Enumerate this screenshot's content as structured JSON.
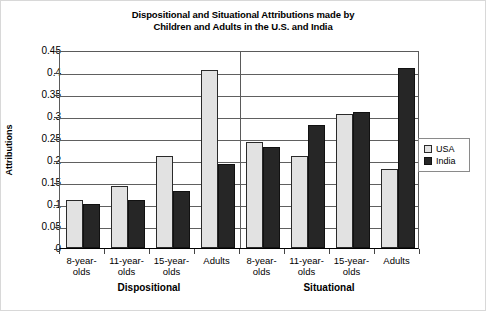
{
  "chart_data": {
    "type": "bar",
    "title": "Dispositional and Situational Attributions made by Children and Adults in the U.S. and India",
    "title_line1": "Dispositional and Situational Attributions made by",
    "title_line2": "Children and Adults in the U.S. and India",
    "xlabel": "",
    "ylabel": "Attributions",
    "ylim": [
      0,
      0.45
    ],
    "ytick_labels": [
      "0.45",
      "0.4",
      "0.35",
      "0.3",
      "0.25",
      "0.2",
      "0.15",
      "0.1",
      "0.05",
      "0"
    ],
    "ytick_values": [
      0.45,
      0.4,
      0.35,
      0.3,
      0.25,
      0.2,
      0.15,
      0.1,
      0.05,
      0
    ],
    "grid": true,
    "grid_axis": "y",
    "legend_position": "right",
    "categories": [
      "8-year-olds",
      "11-year-olds",
      "15-year-olds",
      "Adults",
      "8-year-olds",
      "11-year-olds",
      "15-year-olds",
      "Adults"
    ],
    "category_lines": [
      [
        "8-year-",
        "olds"
      ],
      [
        "11-year-",
        "olds"
      ],
      [
        "15-year-",
        "olds"
      ],
      [
        "Adults",
        ""
      ],
      [
        "8-year-",
        "olds"
      ],
      [
        "11-year-",
        "olds"
      ],
      [
        "15-year-",
        "olds"
      ],
      [
        "Adults",
        ""
      ]
    ],
    "groups": [
      {
        "label": "Dispositional",
        "categories": [
          "8-year-olds",
          "11-year-olds",
          "15-year-olds",
          "Adults"
        ]
      },
      {
        "label": "Situational",
        "categories": [
          "8-year-olds",
          "11-year-olds",
          "15-year-olds",
          "Adults"
        ]
      }
    ],
    "series": [
      {
        "name": "USA",
        "color": "#e2e2e2",
        "values": [
          0.11,
          0.14,
          0.21,
          0.405,
          0.24,
          0.21,
          0.305,
          0.18
        ]
      },
      {
        "name": "India",
        "color": "#262626",
        "values": [
          0.1,
          0.11,
          0.13,
          0.19,
          0.23,
          0.28,
          0.31,
          0.41
        ]
      }
    ]
  },
  "legend": {
    "items": [
      {
        "label": "USA",
        "swatch": "usa"
      },
      {
        "label": "India",
        "swatch": "india"
      }
    ]
  }
}
